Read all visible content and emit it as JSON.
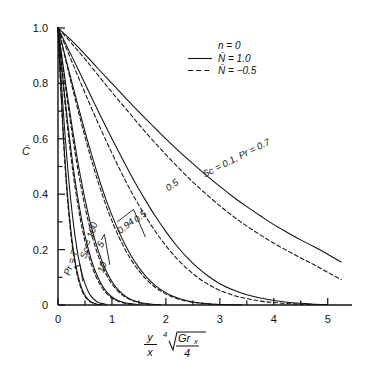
{
  "chart_data": {
    "type": "line",
    "title": "",
    "xlabel": "(y/x) * fourth-root(Gr_x / 4)",
    "ylabel": "C-bar",
    "xlim": [
      0,
      5.45
    ],
    "ylim": [
      0,
      1.0
    ],
    "grid": false,
    "xticks": [
      0,
      1,
      2,
      3,
      4,
      5
    ],
    "xticklabels": [
      "0",
      "1",
      "2",
      "3",
      "4",
      "5"
    ],
    "xminorstep": 0.5,
    "yticks": [
      0,
      0.2,
      0.4,
      0.6,
      0.8,
      1.0
    ],
    "yticklabels": [
      "0",
      "0.2",
      "0.4",
      "0.6",
      "0.8",
      "1.0"
    ],
    "yminorstep": 0.1,
    "legend": {
      "position": "upper-right",
      "header": "n = 0",
      "entries": [
        {
          "label": "N̄ = 1.0",
          "style": "solid"
        },
        {
          "label": "N̄ = −0.5",
          "style": "dashed"
        }
      ]
    },
    "annotations": [
      {
        "text": "Sc = 0.1, Pr = 0.7",
        "x": 2.72,
        "y": 0.46,
        "rotation": -27
      },
      {
        "text": "0.5",
        "x": 2.05,
        "y": 0.41,
        "rotation": -36
      },
      {
        "text": "0.5",
        "x": 1.47,
        "y": 0.295,
        "rotation": -42
      },
      {
        "text": "0.94",
        "x": 1.16,
        "y": 0.255,
        "rotation": -40
      },
      {
        "text": "5",
        "x": 0.82,
        "y": 0.205,
        "rotation": -62
      },
      {
        "text": "10",
        "x": 0.84,
        "y": 0.115,
        "rotation": -70
      },
      {
        "text": "Sc = 100",
        "x": 0.52,
        "y": 0.165,
        "rotation": -72
      },
      {
        "text": "Pr = 7",
        "x": 0.22,
        "y": 0.105,
        "rotation": -72
      }
    ],
    "series": [
      {
        "name": "Sc = 0.1, Pr = 0.7, N-bar = 1.0",
        "style": "solid",
        "points": [
          [
            0,
            1.0
          ],
          [
            0.25,
            0.955
          ],
          [
            0.5,
            0.905
          ],
          [
            0.75,
            0.852
          ],
          [
            1.0,
            0.8
          ],
          [
            1.25,
            0.748
          ],
          [
            1.5,
            0.697
          ],
          [
            1.75,
            0.648
          ],
          [
            2.0,
            0.6
          ],
          [
            2.25,
            0.554
          ],
          [
            2.5,
            0.51
          ],
          [
            2.75,
            0.468
          ],
          [
            3.0,
            0.428
          ],
          [
            3.25,
            0.39
          ],
          [
            3.5,
            0.355
          ],
          [
            3.75,
            0.322
          ],
          [
            4.0,
            0.29
          ],
          [
            4.25,
            0.262
          ],
          [
            4.5,
            0.235
          ],
          [
            4.75,
            0.21
          ],
          [
            5.0,
            0.183
          ],
          [
            5.25,
            0.155
          ]
        ]
      },
      {
        "name": "Sc = 0.1, Pr = 0.7, N-bar = -0.5",
        "style": "dashed",
        "points": [
          [
            0,
            1.0
          ],
          [
            0.25,
            0.945
          ],
          [
            0.5,
            0.888
          ],
          [
            0.75,
            0.828
          ],
          [
            1.0,
            0.768
          ],
          [
            1.25,
            0.71
          ],
          [
            1.5,
            0.652
          ],
          [
            1.75,
            0.596
          ],
          [
            2.0,
            0.543
          ],
          [
            2.25,
            0.492
          ],
          [
            2.5,
            0.444
          ],
          [
            2.75,
            0.4
          ],
          [
            3.0,
            0.358
          ],
          [
            3.25,
            0.32
          ],
          [
            3.5,
            0.285
          ],
          [
            3.75,
            0.253
          ],
          [
            4.0,
            0.223
          ],
          [
            4.25,
            0.196
          ],
          [
            4.5,
            0.17
          ],
          [
            4.75,
            0.145
          ],
          [
            5.0,
            0.118
          ],
          [
            5.25,
            0.092
          ]
        ]
      },
      {
        "name": "Sc = 0.5, N-bar = 1.0 (solid mid)",
        "style": "solid",
        "points": [
          [
            0,
            1.0
          ],
          [
            0.2,
            0.92
          ],
          [
            0.4,
            0.84
          ],
          [
            0.6,
            0.758
          ],
          [
            0.8,
            0.678
          ],
          [
            1.0,
            0.6
          ],
          [
            1.2,
            0.525
          ],
          [
            1.4,
            0.452
          ],
          [
            1.6,
            0.385
          ],
          [
            1.8,
            0.322
          ],
          [
            2.0,
            0.265
          ],
          [
            2.2,
            0.214
          ],
          [
            2.4,
            0.17
          ],
          [
            2.6,
            0.133
          ],
          [
            2.8,
            0.102
          ],
          [
            3.0,
            0.077
          ],
          [
            3.25,
            0.054
          ],
          [
            3.5,
            0.037
          ],
          [
            3.75,
            0.025
          ],
          [
            4.0,
            0.016
          ],
          [
            4.25,
            0.01
          ],
          [
            4.5,
            0.006
          ],
          [
            4.75,
            0.003
          ],
          [
            5.0,
            0.002
          ]
        ]
      },
      {
        "name": "Sc = 0.5 dashed",
        "style": "dashed",
        "points": [
          [
            0,
            1.0
          ],
          [
            0.2,
            0.905
          ],
          [
            0.4,
            0.812
          ],
          [
            0.6,
            0.72
          ],
          [
            0.8,
            0.632
          ],
          [
            1.0,
            0.548
          ],
          [
            1.2,
            0.468
          ],
          [
            1.4,
            0.394
          ],
          [
            1.6,
            0.327
          ],
          [
            1.8,
            0.267
          ],
          [
            2.0,
            0.214
          ],
          [
            2.2,
            0.168
          ],
          [
            2.4,
            0.13
          ],
          [
            2.6,
            0.098
          ],
          [
            2.8,
            0.073
          ],
          [
            3.0,
            0.053
          ],
          [
            3.25,
            0.035
          ],
          [
            3.5,
            0.023
          ],
          [
            3.75,
            0.014
          ],
          [
            4.0,
            0.009
          ],
          [
            4.25,
            0.005
          ],
          [
            4.5,
            0.003
          ],
          [
            4.75,
            0.001
          ]
        ]
      },
      {
        "name": "Sc = 0.94 solid",
        "style": "solid",
        "points": [
          [
            0,
            1.0
          ],
          [
            0.15,
            0.885
          ],
          [
            0.3,
            0.772
          ],
          [
            0.45,
            0.662
          ],
          [
            0.6,
            0.558
          ],
          [
            0.75,
            0.462
          ],
          [
            0.9,
            0.375
          ],
          [
            1.05,
            0.3
          ],
          [
            1.2,
            0.235
          ],
          [
            1.35,
            0.18
          ],
          [
            1.5,
            0.135
          ],
          [
            1.65,
            0.099
          ],
          [
            1.8,
            0.071
          ],
          [
            1.95,
            0.05
          ],
          [
            2.1,
            0.034
          ],
          [
            2.3,
            0.02
          ],
          [
            2.5,
            0.011
          ],
          [
            2.7,
            0.006
          ],
          [
            2.9,
            0.003
          ],
          [
            3.1,
            0.0015
          ],
          [
            3.4,
            0.0005
          ]
        ]
      },
      {
        "name": "Sc = 0.94 dashed",
        "style": "dashed",
        "points": [
          [
            0,
            1.0
          ],
          [
            0.15,
            0.878
          ],
          [
            0.3,
            0.758
          ],
          [
            0.45,
            0.644
          ],
          [
            0.6,
            0.537
          ],
          [
            0.75,
            0.44
          ],
          [
            0.9,
            0.354
          ],
          [
            1.05,
            0.28
          ],
          [
            1.2,
            0.217
          ],
          [
            1.35,
            0.165
          ],
          [
            1.5,
            0.123
          ],
          [
            1.65,
            0.09
          ],
          [
            1.8,
            0.064
          ],
          [
            1.95,
            0.045
          ],
          [
            2.1,
            0.031
          ],
          [
            2.3,
            0.018
          ],
          [
            2.5,
            0.01
          ],
          [
            2.7,
            0.005
          ],
          [
            2.9,
            0.0025
          ],
          [
            3.1,
            0.001
          ]
        ]
      },
      {
        "name": "Sc = 5 solid",
        "style": "solid",
        "points": [
          [
            0,
            1.0
          ],
          [
            0.08,
            0.885
          ],
          [
            0.16,
            0.775
          ],
          [
            0.24,
            0.67
          ],
          [
            0.32,
            0.572
          ],
          [
            0.4,
            0.482
          ],
          [
            0.5,
            0.382
          ],
          [
            0.6,
            0.296
          ],
          [
            0.7,
            0.224
          ],
          [
            0.8,
            0.166
          ],
          [
            0.9,
            0.12
          ],
          [
            1.0,
            0.085
          ],
          [
            1.1,
            0.058
          ],
          [
            1.2,
            0.039
          ],
          [
            1.3,
            0.025
          ],
          [
            1.4,
            0.016
          ],
          [
            1.5,
            0.01
          ],
          [
            1.6,
            0.006
          ],
          [
            1.75,
            0.003
          ],
          [
            1.9,
            0.0012
          ]
        ]
      },
      {
        "name": "Sc = 5 dashed",
        "style": "dashed",
        "points": [
          [
            0,
            1.0
          ],
          [
            0.08,
            0.875
          ],
          [
            0.16,
            0.757
          ],
          [
            0.24,
            0.647
          ],
          [
            0.32,
            0.546
          ],
          [
            0.4,
            0.455
          ],
          [
            0.5,
            0.355
          ],
          [
            0.6,
            0.272
          ],
          [
            0.7,
            0.204
          ],
          [
            0.8,
            0.15
          ],
          [
            0.9,
            0.108
          ],
          [
            1.0,
            0.076
          ],
          [
            1.1,
            0.052
          ],
          [
            1.2,
            0.035
          ],
          [
            1.3,
            0.023
          ],
          [
            1.4,
            0.014
          ],
          [
            1.5,
            0.009
          ],
          [
            1.6,
            0.005
          ],
          [
            1.75,
            0.002
          ]
        ]
      },
      {
        "name": "Sc = 10 solid",
        "style": "solid",
        "points": [
          [
            0,
            1.0
          ],
          [
            0.06,
            0.878
          ],
          [
            0.12,
            0.764
          ],
          [
            0.18,
            0.658
          ],
          [
            0.24,
            0.561
          ],
          [
            0.3,
            0.473
          ],
          [
            0.38,
            0.372
          ],
          [
            0.46,
            0.287
          ],
          [
            0.54,
            0.218
          ],
          [
            0.62,
            0.162
          ],
          [
            0.7,
            0.118
          ],
          [
            0.78,
            0.084
          ],
          [
            0.86,
            0.058
          ],
          [
            0.94,
            0.039
          ],
          [
            1.02,
            0.026
          ],
          [
            1.12,
            0.015
          ],
          [
            1.22,
            0.009
          ],
          [
            1.34,
            0.005
          ],
          [
            1.46,
            0.002
          ]
        ]
      },
      {
        "name": "Sc = 10 dashed",
        "style": "dashed",
        "points": [
          [
            0,
            1.0
          ],
          [
            0.06,
            0.868
          ],
          [
            0.12,
            0.746
          ],
          [
            0.18,
            0.635
          ],
          [
            0.24,
            0.535
          ],
          [
            0.3,
            0.447
          ],
          [
            0.38,
            0.347
          ],
          [
            0.46,
            0.265
          ],
          [
            0.54,
            0.198
          ],
          [
            0.62,
            0.146
          ],
          [
            0.7,
            0.105
          ],
          [
            0.78,
            0.074
          ],
          [
            0.86,
            0.051
          ],
          [
            0.94,
            0.034
          ],
          [
            1.02,
            0.022
          ],
          [
            1.12,
            0.013
          ],
          [
            1.22,
            0.007
          ],
          [
            1.34,
            0.003
          ]
        ]
      },
      {
        "name": "Sc = 100 solid",
        "style": "solid",
        "points": [
          [
            0,
            1.0
          ],
          [
            0.03,
            0.875
          ],
          [
            0.06,
            0.758
          ],
          [
            0.09,
            0.65
          ],
          [
            0.12,
            0.552
          ],
          [
            0.16,
            0.44
          ],
          [
            0.2,
            0.346
          ],
          [
            0.25,
            0.251
          ],
          [
            0.3,
            0.178
          ],
          [
            0.35,
            0.124
          ],
          [
            0.4,
            0.084
          ],
          [
            0.45,
            0.055
          ],
          [
            0.5,
            0.035
          ],
          [
            0.55,
            0.022
          ],
          [
            0.6,
            0.013
          ],
          [
            0.66,
            0.007
          ],
          [
            0.72,
            0.003
          ],
          [
            0.8,
            0.001
          ]
        ]
      },
      {
        "name": "Sc = 100 dashed",
        "style": "dashed",
        "points": [
          [
            0,
            1.0
          ],
          [
            0.03,
            0.865
          ],
          [
            0.06,
            0.742
          ],
          [
            0.09,
            0.632
          ],
          [
            0.12,
            0.532
          ],
          [
            0.16,
            0.42
          ],
          [
            0.2,
            0.327
          ],
          [
            0.25,
            0.234
          ],
          [
            0.3,
            0.164
          ],
          [
            0.35,
            0.113
          ],
          [
            0.4,
            0.076
          ],
          [
            0.45,
            0.049
          ],
          [
            0.5,
            0.031
          ],
          [
            0.55,
            0.019
          ],
          [
            0.6,
            0.011
          ],
          [
            0.66,
            0.006
          ],
          [
            0.72,
            0.0025
          ]
        ]
      },
      {
        "name": "Pr = 7 solid",
        "style": "solid",
        "points": [
          [
            0,
            1.0
          ],
          [
            0.04,
            0.872
          ],
          [
            0.08,
            0.752
          ],
          [
            0.12,
            0.642
          ],
          [
            0.16,
            0.542
          ],
          [
            0.21,
            0.43
          ],
          [
            0.26,
            0.336
          ],
          [
            0.32,
            0.243
          ],
          [
            0.38,
            0.17
          ],
          [
            0.44,
            0.116
          ],
          [
            0.5,
            0.077
          ],
          [
            0.56,
            0.049
          ],
          [
            0.62,
            0.03
          ],
          [
            0.68,
            0.018
          ],
          [
            0.74,
            0.01
          ],
          [
            0.82,
            0.005
          ],
          [
            0.9,
            0.002
          ]
        ]
      }
    ]
  },
  "axis": {
    "y_axis_title": "C̄",
    "x_formula": {
      "numerator": "y",
      "denominator": "x",
      "root_index": "4",
      "radicand_top": "Gr",
      "radicand_sub": "x",
      "radicand_bottom": "4"
    }
  }
}
